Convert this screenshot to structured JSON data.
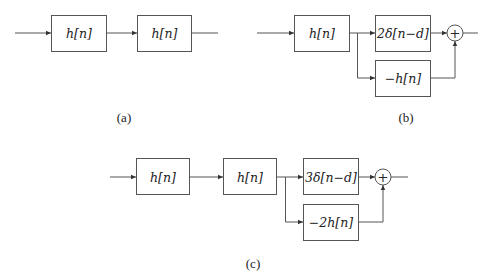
{
  "diagrams": {
    "a": {
      "caption": "(a)",
      "blocks": [
        {
          "label": "h[n]"
        },
        {
          "label": "h[n]"
        }
      ]
    },
    "b": {
      "caption": "(b)",
      "blocks": [
        {
          "label": "h[n]"
        },
        {
          "label": "2δ[n−d]"
        },
        {
          "label": "−h[n]"
        }
      ],
      "sum_symbol": "+"
    },
    "c": {
      "caption": "(c)",
      "blocks": [
        {
          "label": "h[n]"
        },
        {
          "label": "h[n]"
        },
        {
          "label": "3δ[n−d]"
        },
        {
          "label": "−2h[n]"
        }
      ],
      "sum_symbol": "+"
    }
  },
  "colors": {
    "line": "#555555",
    "text": "#222222",
    "background": "#ffffff"
  }
}
